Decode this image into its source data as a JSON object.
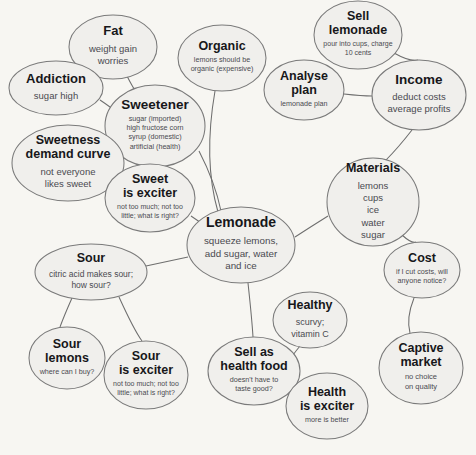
{
  "diagram": {
    "type": "mind-map",
    "background_color": "#f7f6f2",
    "node_fill_color": "#f0efec",
    "node_stroke_color": "#7a7a7a",
    "edge_color": "#6e6e6e",
    "title_text_color": "#17171a",
    "description_text_color": "#4a4a50"
  },
  "nodes": [
    {
      "id": "fat",
      "title": [
        "Fat"
      ],
      "desc": [
        "weight gain",
        "worries"
      ],
      "cx": 113,
      "cy": 47,
      "rx": 44,
      "ry": 32,
      "title_size": 13,
      "desc_size": 9.5
    },
    {
      "id": "addiction",
      "title": [
        "Addiction"
      ],
      "desc": [
        "sugar high"
      ],
      "cx": 56,
      "cy": 88,
      "rx": 47,
      "ry": 27,
      "title_size": 13,
      "desc_size": 9.5
    },
    {
      "id": "organic",
      "title": [
        "Organic"
      ],
      "desc": [
        "lemons should be",
        "organic (expensive)"
      ],
      "cx": 222,
      "cy": 58,
      "rx": 44,
      "ry": 33,
      "title_size": 12.5,
      "desc_size": 7.2
    },
    {
      "id": "sweetener",
      "title": [
        "Sweetener"
      ],
      "desc": [
        "sugar (imported)",
        "high fructose corn",
        "syrup (domestic)",
        "artificial (health)"
      ],
      "cx": 155,
      "cy": 126,
      "rx": 50,
      "ry": 41,
      "title_size": 13.5,
      "desc_size": 7.2
    },
    {
      "id": "sweetness-demand-curve",
      "title": [
        "Sweetness",
        "demand curve"
      ],
      "desc": [
        "not everyone",
        "likes sweet"
      ],
      "cx": 68,
      "cy": 163,
      "rx": 56,
      "ry": 38,
      "title_size": 12.5,
      "desc_size": 9.5
    },
    {
      "id": "sweet-is-exciter",
      "title": [
        "Sweet",
        "is exciter"
      ],
      "desc": [
        "not too much; not too",
        "little; what is right?"
      ],
      "cx": 150,
      "cy": 198,
      "rx": 45,
      "ry": 34,
      "title_size": 12.5,
      "desc_size": 7.0
    },
    {
      "id": "lemonade",
      "title": [
        "Lemonade"
      ],
      "desc": [
        "squeeze lemons,",
        "add sugar, water",
        "and ice"
      ],
      "cx": 241,
      "cy": 245,
      "rx": 54,
      "ry": 38,
      "title_size": 14,
      "desc_size": 9.8
    },
    {
      "id": "sell-lemonade",
      "title": [
        "Sell",
        "lemonade"
      ],
      "desc": [
        "pour into cups, charge",
        "10 cents"
      ],
      "cx": 358,
      "cy": 35,
      "rx": 44,
      "ry": 34,
      "title_size": 12.5,
      "desc_size": 7.0
    },
    {
      "id": "analyse-plan",
      "title": [
        "Analyse",
        "plan"
      ],
      "desc": [
        "lemonade plan"
      ],
      "cx": 304,
      "cy": 90,
      "rx": 40,
      "ry": 30,
      "title_size": 12.5,
      "desc_size": 7.2
    },
    {
      "id": "income",
      "title": [
        "Income"
      ],
      "desc": [
        "deduct costs",
        "average profits"
      ],
      "cx": 419,
      "cy": 95,
      "rx": 47,
      "ry": 35,
      "title_size": 13.5,
      "desc_size": 9.5
    },
    {
      "id": "materials",
      "title": [
        "Materials"
      ],
      "desc": [
        "lemons",
        "cups",
        "ice",
        "water",
        "sugar"
      ],
      "cx": 373,
      "cy": 202,
      "rx": 46,
      "ry": 44,
      "title_size": 12.5,
      "desc_size": 9.5
    },
    {
      "id": "cost",
      "title": [
        "Cost"
      ],
      "desc": [
        "if I cut costs, will",
        "anyone notice?"
      ],
      "cx": 422,
      "cy": 270,
      "rx": 38,
      "ry": 28,
      "title_size": 12.5,
      "desc_size": 7.2
    },
    {
      "id": "captive-market",
      "title": [
        "Captive",
        "market"
      ],
      "desc": [
        "no choice",
        "on quality"
      ],
      "cx": 421,
      "cy": 368,
      "rx": 42,
      "ry": 36,
      "title_size": 12.5,
      "desc_size": 7.5
    },
    {
      "id": "sour",
      "title": [
        "Sour"
      ],
      "desc": [
        "citric acid makes sour;",
        "how sour?"
      ],
      "cx": 91,
      "cy": 272,
      "rx": 56,
      "ry": 28,
      "title_size": 12.5,
      "desc_size": 8.5
    },
    {
      "id": "sour-lemons",
      "title": [
        "Sour",
        "lemons"
      ],
      "desc": [
        "where can I buy?"
      ],
      "cx": 67,
      "cy": 358,
      "rx": 38,
      "ry": 31,
      "title_size": 12.5,
      "desc_size": 7.2
    },
    {
      "id": "sour-is-exciter",
      "title": [
        "Sour",
        "is exciter"
      ],
      "desc": [
        "not too much; not too",
        "little; what is right?"
      ],
      "cx": 146,
      "cy": 375,
      "rx": 42,
      "ry": 34,
      "title_size": 12.5,
      "desc_size": 7.0
    },
    {
      "id": "sell-as-health-food",
      "title": [
        "Sell as",
        "health food"
      ],
      "desc": [
        "doesn't have to",
        "taste good?"
      ],
      "cx": 254,
      "cy": 371,
      "rx": 46,
      "ry": 34,
      "title_size": 12.5,
      "desc_size": 7.2
    },
    {
      "id": "healthy",
      "title": [
        "Healthy"
      ],
      "desc": [
        "scurvy;",
        "vitamin C"
      ],
      "cx": 310,
      "cy": 320,
      "rx": 37,
      "ry": 28,
      "title_size": 12.5,
      "desc_size": 9.0
    },
    {
      "id": "health-is-exciter",
      "title": [
        "Health",
        "is exciter"
      ],
      "desc": [
        "more is better"
      ],
      "cx": 327,
      "cy": 406,
      "rx": 41,
      "ry": 33,
      "title_size": 12.5,
      "desc_size": 7.2
    }
  ],
  "edges": [
    {
      "id": "fat-sweetener",
      "from": "fat",
      "to": "sweetener",
      "d": "M 127 76 Q 133 88 137 93"
    },
    {
      "id": "addiction-sweetener",
      "from": "addiction",
      "to": "sweetener",
      "d": "M 100 100 Q 112 108 120 115"
    },
    {
      "id": "organic-lemonade",
      "from": "organic",
      "to": "lemonade",
      "d": "M 215 91 Q 203 160 218 212"
    },
    {
      "id": "sweetener-lemonade",
      "from": "sweetener",
      "to": "lemonade",
      "d": "M 199 151 Q 215 182 221 211"
    },
    {
      "id": "sweetness-sweet-exciter",
      "from": "sweetness-demand-curve",
      "to": "sweet-is-exciter",
      "d": "M 118 183 Q 128 188 136 191"
    },
    {
      "id": "sweet-exciter-lemonade",
      "from": "sweet-is-exciter",
      "to": "lemonade",
      "d": "M 191 216 Q 200 222 208 228"
    },
    {
      "id": "sell-lemonade-income",
      "from": "sell-lemonade",
      "to": "income",
      "d": "M 394 53 Q 410 62 418 60"
    },
    {
      "id": "analyse-plan-income",
      "from": "analyse-plan",
      "to": "income",
      "d": "M 344 94 Q 362 96 372 96"
    },
    {
      "id": "income-materials",
      "from": "income",
      "to": "materials",
      "d": "M 412 130 Q 398 148 386 160"
    },
    {
      "id": "materials-lemonade",
      "from": "materials",
      "to": "lemonade",
      "d": "M 328 216 Q 312 226 295 237"
    },
    {
      "id": "materials-cost",
      "from": "materials",
      "to": "cost",
      "d": "M 402 235 Q 412 244 416 242"
    },
    {
      "id": "cost-captive-market",
      "from": "cost",
      "to": "captive-market",
      "d": "M 414 298 Q 406 318 410 333"
    },
    {
      "id": "lemonade-sour",
      "from": "lemonade",
      "to": "sour",
      "d": "M 188 257 Q 165 262 146 266"
    },
    {
      "id": "sour-sour-lemons",
      "from": "sour",
      "to": "sour-lemons",
      "d": "M 72 298 Q 64 316 60 327"
    },
    {
      "id": "sour-sour-is-exciter",
      "from": "sour",
      "to": "sour-is-exciter",
      "d": "M 119 297 Q 134 330 142 341"
    },
    {
      "id": "lemonade-sell-health-food",
      "from": "lemonade",
      "to": "sell-as-health-food",
      "d": "M 248 283 Q 252 320 253 337"
    },
    {
      "id": "healthy-sell-health-food",
      "from": "healthy",
      "to": "sell-as-health-food",
      "d": "M 300 346 Q 290 358 288 364"
    },
    {
      "id": "sell-health-food-health-exciter",
      "from": "sell-as-health-food",
      "to": "health-is-exciter",
      "d": "M 292 383 Q 300 388 307 390"
    }
  ]
}
